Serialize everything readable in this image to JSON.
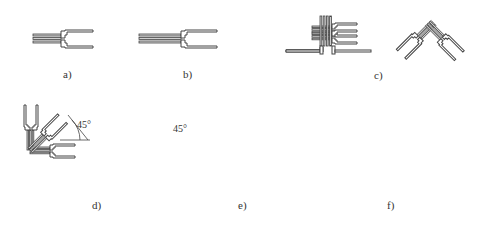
{
  "figure": {
    "panels": [
      {
        "id": "a",
        "label": "a)",
        "description": "single-element strain gauge"
      },
      {
        "id": "b",
        "label": "b)",
        "description": "single-element strain gauge, longer grid"
      },
      {
        "id": "c",
        "label": "c)",
        "description": "two-element 90° rosette (stacked and planar)"
      },
      {
        "id": "d",
        "label": "d)",
        "description": "three-element 45° rosette (stacked and planar)"
      },
      {
        "id": "e",
        "label": "e)",
        "description": "three-element 60° delta rosette"
      },
      {
        "id": "f",
        "label": "f)",
        "description": "three-element 120° rosette (stacked and planar)"
      }
    ],
    "annotations": {
      "angle_d_left": "45°",
      "angle_d_right": "45°"
    }
  }
}
